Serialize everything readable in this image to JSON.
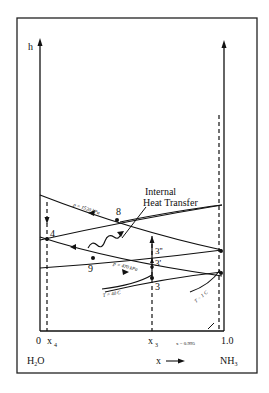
{
  "figure": {
    "type": "enthalpy-concentration diagram",
    "y_axis_label": "h",
    "x_axis_label": "x",
    "x_left_species": "H2O",
    "x_right_species": "NH3",
    "x_left_value": "0",
    "x_right_value": "1.0",
    "ticks": [
      {
        "name": "x4",
        "label": "x",
        "sub": "4"
      },
      {
        "name": "x3",
        "label": "x",
        "sub": "3"
      },
      {
        "name": "x0995",
        "label": "x = 0.995"
      }
    ],
    "curves": [
      {
        "name": "isobar-high",
        "label": "p = 1520 kPa"
      },
      {
        "name": "isobar-low",
        "label": "p = 470 kPa"
      },
      {
        "name": "isotherm-40",
        "label": "T = 40 C"
      },
      {
        "name": "isotherm-1",
        "label": "T = 1 C"
      }
    ],
    "points": [
      "4",
      "8",
      "9",
      "3",
      "3'",
      "3''"
    ],
    "annotation": {
      "line1": "Internal",
      "line2": "Heat Transfer"
    }
  }
}
